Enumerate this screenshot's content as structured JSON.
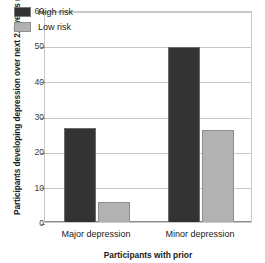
{
  "chart_data": {
    "type": "bar",
    "title": "",
    "xlabel": "Participants with prior",
    "ylabel": "Participants developing depression over next 2.5 years (%)",
    "categories": [
      "Major depression",
      "Minor depression"
    ],
    "series": [
      {
        "name": "High risk",
        "color": "#333333",
        "values": [
          26.5,
          49.5
        ]
      },
      {
        "name": "Low risk",
        "color": "#b2b2b2",
        "values": [
          5.8,
          26.0
        ]
      }
    ],
    "ylim": [
      0,
      60
    ],
    "yticks": [
      0,
      10,
      20,
      30,
      40,
      50,
      60
    ],
    "ytick_labels": [
      "0",
      "10",
      "20",
      "30",
      "40",
      "50",
      "60"
    ],
    "grid": true,
    "legend_position": "top-left"
  }
}
